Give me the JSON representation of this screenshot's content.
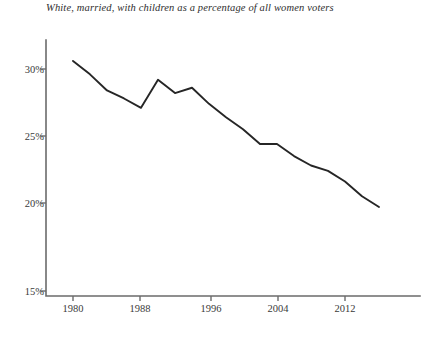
{
  "chart_data": {
    "type": "line",
    "title": "White, married, with children as a percentage of all women voters",
    "subtitle": "",
    "xlabel": "",
    "ylabel": "",
    "xlim": [
      1979,
      2016
    ],
    "ylim": [
      15,
      32
    ],
    "grid": false,
    "legend": null,
    "yticks": [
      15,
      20,
      25,
      30
    ],
    "ytick_labels": [
      "15%",
      "20%",
      "25%",
      "30%"
    ],
    "xticks": [
      1980,
      1988,
      1996,
      2004,
      2012
    ],
    "xtick_labels": [
      "1980",
      "1988",
      "1996",
      "2004",
      "2012"
    ],
    "series": [
      {
        "name": "White, married, with children",
        "color": "#262626",
        "x": [
          1980,
          1982,
          1984,
          1986,
          1988,
          1990,
          1992,
          1994,
          1996,
          1998,
          2000,
          2002,
          2004,
          2006,
          2008,
          2010,
          2012,
          2014,
          2016
        ],
        "values": [
          30.6,
          29.6,
          28.4,
          27.8,
          27.1,
          29.2,
          28.2,
          28.6,
          27.4,
          26.4,
          25.5,
          24.4,
          24.4,
          23.5,
          22.8,
          22.4,
          21.6,
          20.5,
          19.7
        ]
      }
    ],
    "annotations": []
  },
  "figure": {
    "title": "White, married, with children as a percentage of all women voters",
    "axis_color": "#6b6b6b",
    "line_color": "#262626",
    "background": "#ffffff",
    "caption_clipped": ""
  }
}
